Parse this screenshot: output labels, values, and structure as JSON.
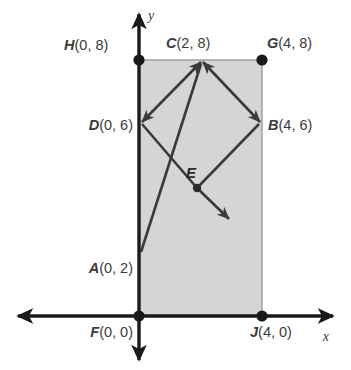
{
  "figure": {
    "axis_labels": {
      "x": "x",
      "y": "y"
    },
    "colors": {
      "rect_fill": "#d5d5d5",
      "rect_stroke": "#8f8f8f",
      "axis": "#1a1a1a",
      "vector": "#3a3a3a",
      "label_text": "#3b3b3b",
      "background": "#ffffff"
    },
    "points": [
      {
        "id": "H",
        "name": "H",
        "coords": "(0, 8)",
        "label": "H(0, 8)",
        "x": 0,
        "y": 8,
        "dot": true
      },
      {
        "id": "C",
        "name": "C",
        "coords": "(2, 8)",
        "label": "C(2, 8)",
        "x": 2,
        "y": 8,
        "dot": false
      },
      {
        "id": "G",
        "name": "G",
        "coords": "(4, 8)",
        "label": "G(4, 8)",
        "x": 4,
        "y": 8,
        "dot": true
      },
      {
        "id": "D",
        "name": "D",
        "coords": "(0, 6)",
        "label": "D(0, 6)",
        "x": 0,
        "y": 6,
        "dot": false
      },
      {
        "id": "B",
        "name": "B",
        "coords": "(4, 6)",
        "label": "B(4, 6)",
        "x": 4,
        "y": 6,
        "dot": false
      },
      {
        "id": "E",
        "name": "E",
        "coords": "",
        "label": "E",
        "x": 2,
        "y": 4,
        "dot": true
      },
      {
        "id": "A",
        "name": "A",
        "coords": "(0, 2)",
        "label": "A(0, 2)",
        "x": 0,
        "y": 2,
        "dot": false
      },
      {
        "id": "F",
        "name": "F",
        "coords": "(0, 0)",
        "label": "F(0, 0)",
        "x": 0,
        "y": 0,
        "dot": true
      },
      {
        "id": "J",
        "name": "J",
        "coords": "(4, 0)",
        "label": "J(4, 0)",
        "x": 4,
        "y": 0,
        "dot": true
      }
    ],
    "rectangle": {
      "vertices": "F(0,0), J(4,0), G(4,8), H(0,8)",
      "fill": "#d5d5d5"
    },
    "vectors": [
      {
        "id": "DC",
        "from": "C(2,8)",
        "to": "D(0,6)",
        "double_headed": true
      },
      {
        "id": "CB",
        "from": "C(2,8)",
        "to": "B(4,6)",
        "double_headed": true
      },
      {
        "id": "AC",
        "from": "A(0,2)",
        "to": "C(2,8)",
        "double_headed": false
      },
      {
        "id": "E-ray",
        "from": "E",
        "to": "down-right",
        "double_headed": false
      }
    ]
  }
}
